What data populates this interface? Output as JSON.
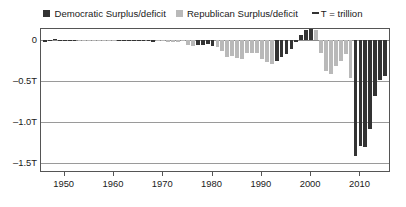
{
  "legend": {
    "democratic_swatch_color": "#333333",
    "democratic_label": "Democratic Surplus/deficit",
    "republican_swatch_color": "#b9b9b9",
    "republican_label": "Republican Surplus/deficit",
    "note_label": "T = trillion"
  },
  "axes": {
    "y_ticks": [
      "0",
      "–0.5T",
      "–1.0T",
      "–1.5T"
    ],
    "y_tick_values": [
      0,
      -0.5,
      -1.0,
      -1.5
    ],
    "x_ticks": [
      "1950",
      "1960",
      "1970",
      "1980",
      "1990",
      "2000",
      "2010"
    ],
    "x_tick_values": [
      1950,
      1960,
      1970,
      1980,
      1990,
      2000,
      2010
    ]
  },
  "chart_data": {
    "type": "bar",
    "title": "",
    "xlabel": "",
    "ylabel": "",
    "xlim": [
      1945.2,
      2016.2
    ],
    "ylim": [
      -1.62,
      0.14
    ],
    "grid": true,
    "legend_position": "top-center",
    "unit": "trillion USD",
    "series": [
      {
        "name": "Democratic Surplus/deficit",
        "color": "#333333"
      },
      {
        "name": "Republican Surplus/deficit",
        "color": "#b9b9b9"
      }
    ],
    "categories": [
      1946,
      1947,
      1948,
      1949,
      1950,
      1951,
      1952,
      1953,
      1954,
      1955,
      1956,
      1957,
      1958,
      1959,
      1960,
      1961,
      1962,
      1963,
      1964,
      1965,
      1966,
      1967,
      1968,
      1969,
      1970,
      1971,
      1972,
      1973,
      1974,
      1975,
      1976,
      1977,
      1978,
      1979,
      1980,
      1981,
      1982,
      1983,
      1984,
      1985,
      1986,
      1987,
      1988,
      1989,
      1990,
      1991,
      1992,
      1993,
      1994,
      1995,
      1996,
      1997,
      1998,
      1999,
      2000,
      2001,
      2002,
      2003,
      2004,
      2005,
      2006,
      2007,
      2008,
      2009,
      2010,
      2011,
      2012,
      2013,
      2014,
      2015
    ],
    "values": [
      -0.016,
      0.004,
      0.012,
      0.001,
      -0.003,
      0.006,
      -0.002,
      -0.006,
      -0.001,
      -0.003,
      0.004,
      0.003,
      -0.003,
      -0.013,
      0.0,
      -0.003,
      -0.007,
      -0.005,
      -0.006,
      -0.001,
      -0.004,
      -0.009,
      -0.025,
      0.003,
      -0.003,
      -0.023,
      -0.023,
      -0.015,
      -0.006,
      -0.053,
      -0.074,
      -0.054,
      -0.059,
      -0.041,
      -0.074,
      -0.079,
      -0.128,
      -0.208,
      -0.185,
      -0.212,
      -0.221,
      -0.15,
      -0.155,
      -0.153,
      -0.221,
      -0.269,
      -0.29,
      -0.255,
      -0.203,
      -0.164,
      -0.107,
      -0.022,
      0.069,
      0.126,
      0.236,
      0.128,
      -0.158,
      -0.378,
      -0.413,
      -0.318,
      -0.248,
      -0.161,
      -0.459,
      -1.413,
      -1.294,
      -1.3,
      -1.087,
      -0.68,
      -0.485,
      -0.438
    ],
    "party": [
      "D",
      "D",
      "D",
      "D",
      "D",
      "D",
      "D",
      "R",
      "R",
      "R",
      "R",
      "R",
      "R",
      "R",
      "R",
      "D",
      "D",
      "D",
      "D",
      "D",
      "D",
      "D",
      "D",
      "R",
      "R",
      "R",
      "R",
      "R",
      "R",
      "R",
      "R",
      "D",
      "D",
      "D",
      "D",
      "R",
      "R",
      "R",
      "R",
      "R",
      "R",
      "R",
      "R",
      "R",
      "R",
      "R",
      "R",
      "D",
      "D",
      "D",
      "D",
      "D",
      "D",
      "D",
      "D",
      "R",
      "R",
      "R",
      "R",
      "R",
      "R",
      "R",
      "R",
      "D",
      "D",
      "D",
      "D",
      "D",
      "D",
      "D"
    ],
    "annotations": []
  }
}
